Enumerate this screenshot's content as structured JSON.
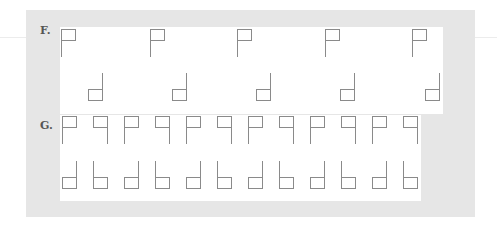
{
  "sections": [
    {
      "label": "F.",
      "top_row": [
        "p",
        "p",
        "p",
        "p",
        "p"
      ],
      "bottom_row": [
        "d",
        "d",
        "d",
        "d",
        "d"
      ]
    },
    {
      "label": "G.",
      "top_row": [
        "p",
        "q",
        "p",
        "q",
        "p",
        "q",
        "p",
        "q",
        "p",
        "q",
        "p",
        "q"
      ],
      "bottom_row": [
        "d",
        "b",
        "d",
        "b",
        "d",
        "b",
        "d",
        "b",
        "d",
        "b",
        "d",
        "b"
      ]
    }
  ],
  "colors": {
    "panel": "#e6e6e6",
    "area": "#ffffff",
    "stroke": "#8a8a8a",
    "label": "#555555"
  }
}
